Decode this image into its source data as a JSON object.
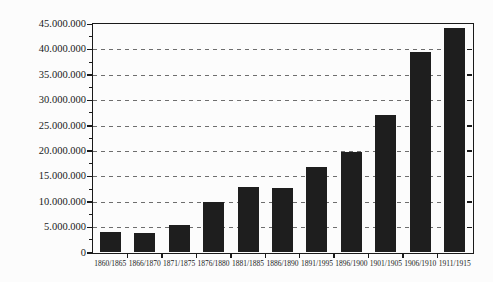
{
  "page": {
    "background_color": "#fcfcfc"
  },
  "chart_data": {
    "type": "bar",
    "title": "",
    "xlabel": "",
    "ylabel": "",
    "categories": [
      "1860/1865",
      "1866/1870",
      "1871/1875",
      "1876/1880",
      "1881/1885",
      "1886/1890",
      "1891/1995",
      "1896/1900",
      "1901/1905",
      "1906/1910",
      "1911/1915"
    ],
    "values": [
      4100000,
      3800000,
      5400000,
      9900000,
      12900000,
      12700000,
      16900000,
      19800000,
      27000000,
      39400000,
      44300000
    ],
    "ylim": [
      0,
      45000000
    ],
    "ytick_interval": 5000000,
    "ytick_labels_top_to_bottom": [
      "45.000.000",
      "40.000.000",
      "35.000.000",
      "30.000.000",
      "25.000.000",
      "20.000.000",
      "15.000.000",
      "10.000.000",
      "5.000.000",
      "0"
    ],
    "grid": "horizontal-dashed",
    "legend": "none",
    "colors": {
      "bar": "#1e1e1e",
      "axis": "#1a1a1a",
      "gridline": "#6e6e6e",
      "label": "#1a1a1a",
      "background": "#fcfcfc"
    }
  }
}
